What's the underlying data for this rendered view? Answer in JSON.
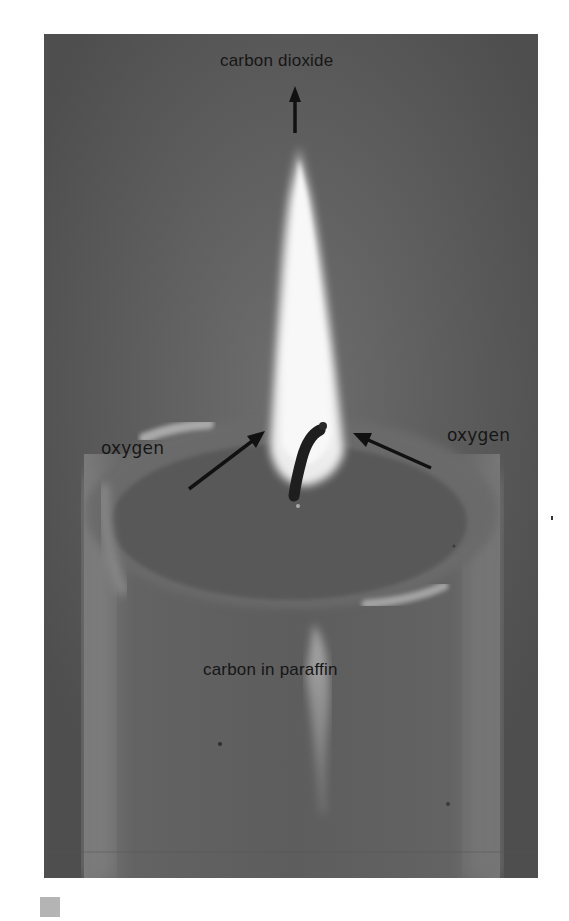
{
  "figure": {
    "labels": {
      "top": "carbon dioxide",
      "left": "oxygen",
      "right": "oxygen",
      "bottom": "carbon in paraffin"
    },
    "arrows": [
      {
        "from": "flame-tip",
        "to": "carbon dioxide",
        "direction": "up"
      },
      {
        "from": "oxygen (left)",
        "to": "flame base",
        "direction": "up-right"
      },
      {
        "from": "oxygen (right)",
        "to": "flame base",
        "direction": "up-left"
      }
    ],
    "colors": {
      "background": "#5c5c5c",
      "flame": "#f2f2f2",
      "wick": "#1e1e1e",
      "label_text": "#161616",
      "marker": "#b4b4b4"
    }
  }
}
